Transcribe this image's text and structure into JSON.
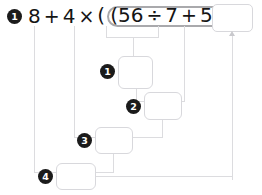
{
  "worksheet": {
    "problem_number": "1",
    "expression": {
      "lead_terms": [
        "8",
        "4"
      ],
      "operators": {
        "plus": "+",
        "times": "×",
        "divide": "÷",
        "equals": "="
      },
      "paren_open": "(",
      "paren_close": ")",
      "grouped_terms": [
        "56",
        "7",
        "5"
      ],
      "full_text": "8 + 4 × (56 ÷ 7 + 5) =",
      "answer_value": "",
      "answer_placeholder": ""
    },
    "steps": [
      {
        "number": "1",
        "value": "",
        "placeholder": "",
        "operation": "56 ÷ 7"
      },
      {
        "number": "2",
        "value": "",
        "placeholder": "",
        "operation": "+ 5"
      },
      {
        "number": "3",
        "value": "",
        "placeholder": "",
        "operation": "4 ×"
      },
      {
        "number": "4",
        "value": "",
        "placeholder": "",
        "operation": "8 +"
      }
    ],
    "colors": {
      "ink": "#151515",
      "bullet_fill": "#1b1b1b",
      "bullet_text": "#ffffff",
      "box_border": "#d8d8dc",
      "connector": "#dcdcdf",
      "paren_highlight": "#a9a9ac",
      "background": "#ffffff"
    }
  }
}
